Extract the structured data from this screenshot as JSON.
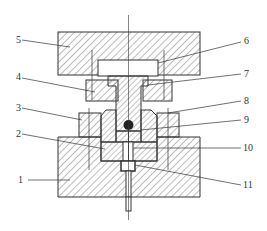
{
  "diagram": {
    "type": "mechanical cross-section",
    "parts": [
      {
        "id": "1",
        "label": "1",
        "desc": "lower die base"
      },
      {
        "id": "2",
        "label": "2",
        "desc": "lower insert"
      },
      {
        "id": "3",
        "label": "3",
        "desc": "lower retaining ring"
      },
      {
        "id": "4",
        "label": "4",
        "desc": "upper retaining ring"
      },
      {
        "id": "5",
        "label": "5",
        "desc": "upper die plate"
      },
      {
        "id": "6",
        "label": "6",
        "desc": "backing plate"
      },
      {
        "id": "7",
        "label": "7",
        "desc": "punch"
      },
      {
        "id": "8",
        "label": "8",
        "desc": "sample ball"
      },
      {
        "id": "9",
        "label": "9",
        "desc": "die sleeve"
      },
      {
        "id": "10",
        "label": "10",
        "desc": "support bore"
      },
      {
        "id": "11",
        "label": "11",
        "desc": "ejector pin"
      }
    ],
    "colors": {
      "line": "#333333",
      "hatch": "#555555",
      "background": "#ffffff"
    }
  },
  "labels": {
    "l1": "1",
    "l2": "2",
    "l3": "3",
    "l4": "4",
    "l5": "5",
    "l6": "6",
    "l7": "7",
    "l8": "8",
    "l9": "9",
    "l10": "10",
    "l11": "11"
  }
}
